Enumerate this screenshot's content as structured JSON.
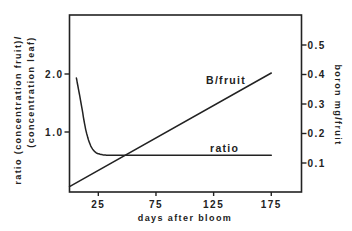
{
  "chart_data": {
    "type": "line",
    "title": "",
    "xlabel": "days after bloom",
    "ylabel_left": "ratio (concentration fruit)/(concentration leaf)",
    "ylabel_left_lines": [
      "ratio (concentration fruit)/",
      "(concentration leaf)"
    ],
    "ylabel_right": "boron mg/fruit",
    "x_ticks": [
      25,
      75,
      125,
      175
    ],
    "x_tick_labels": [
      "25",
      "75",
      "125",
      "175"
    ],
    "xlim": [
      0,
      200
    ],
    "y_left_ticks": [
      1.0,
      2.0
    ],
    "y_left_tick_labels": [
      "1.0",
      "2.0"
    ],
    "ylim_left": [
      0,
      2.9
    ],
    "y_right_ticks": [
      0.1,
      0.2,
      0.3,
      0.4,
      0.5
    ],
    "y_right_tick_labels": [
      "0.1",
      "0.2",
      "0.3",
      "0.4",
      "0.5"
    ],
    "ylim_right": [
      0,
      0.6
    ],
    "grid": false,
    "legend": "inline labels",
    "series": [
      {
        "name": "B/fruit",
        "axis": "right",
        "x": [
          0,
          175
        ],
        "values": [
          0.02,
          0.405
        ]
      },
      {
        "name": "ratio",
        "axis": "left",
        "x": [
          6,
          10,
          14,
          18,
          22,
          26,
          32,
          40,
          60,
          100,
          140,
          175
        ],
        "values": [
          1.93,
          1.5,
          1.05,
          0.78,
          0.66,
          0.62,
          0.6,
          0.6,
          0.6,
          0.6,
          0.6,
          0.6
        ]
      }
    ],
    "annotations": [
      {
        "text": "B/fruit",
        "x": 130,
        "y_right": 0.37
      },
      {
        "text": "ratio",
        "x": 135,
        "y_left": 0.68
      }
    ]
  }
}
